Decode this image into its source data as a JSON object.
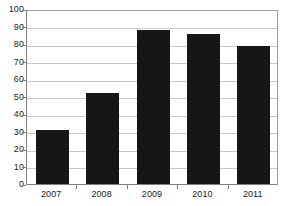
{
  "chart_data": {
    "type": "bar",
    "title": "",
    "subtitle": "",
    "xlabel": "",
    "ylabel": "",
    "categories": [
      "2007",
      "2008",
      "2009",
      "2010",
      "2011"
    ],
    "values": [
      31,
      52,
      88,
      86,
      79
    ],
    "ylim": [
      0,
      100
    ],
    "ytick_step": 10,
    "yticks": [
      "0",
      "10",
      "20",
      "30",
      "40",
      "50",
      "60",
      "70",
      "80",
      "90",
      "100"
    ],
    "grid": "horizontal",
    "legend": "none",
    "series": [
      {
        "name": "",
        "values": [
          31,
          52,
          88,
          86,
          79
        ],
        "color": "#161616"
      }
    ],
    "colors": {
      "bar": "#161616",
      "gridline": "#c9c9c9",
      "axis": "#7f7f7f",
      "plot_background": "#ffffff",
      "text": "#1b1b1b"
    }
  }
}
